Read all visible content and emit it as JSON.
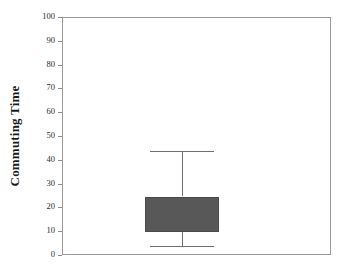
{
  "chart_data": {
    "type": "box",
    "title": "",
    "xlabel": "",
    "ylabel": "Commuting Time",
    "ylim": [
      0,
      100
    ],
    "y_ticks": [
      0,
      10,
      20,
      30,
      40,
      50,
      60,
      70,
      80,
      90,
      100
    ],
    "y_tick_labels": [
      "0",
      "10",
      "20",
      "30",
      "40",
      "50",
      "60",
      "70",
      "80",
      "90",
      "100"
    ],
    "grid": false,
    "legend": null,
    "categories": [
      ""
    ],
    "series": [
      {
        "name": "Commuting Time",
        "min": 4,
        "q1": 10,
        "median": null,
        "q3": 25,
        "max": 44,
        "outliers": []
      }
    ],
    "colors": {
      "box_fill": "#585858",
      "box_edge": "#4a4a4a",
      "whisker": "#6e6e6e",
      "frame": "#9a9a9a",
      "text": "#2b2b2b",
      "background": "#ffffff"
    }
  },
  "axis": {
    "y_title": "Commuting Time"
  }
}
